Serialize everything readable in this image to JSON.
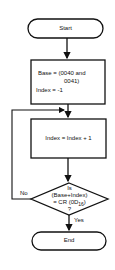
{
  "flowchart": {
    "start": {
      "label": "Start"
    },
    "init": {
      "line1": "Base = (0040 and",
      "line2": "0041)",
      "line3": "Index = -1"
    },
    "increment": {
      "label": "Index = Index + 1"
    },
    "decision": {
      "line1": "Is",
      "line2": "(Base+Index)",
      "line3": "= CR (0D",
      "sub": "16",
      "line3_end": ")",
      "line4": "?"
    },
    "yes_label": "Yes",
    "no_label": "No",
    "end": {
      "label": "End"
    }
  }
}
